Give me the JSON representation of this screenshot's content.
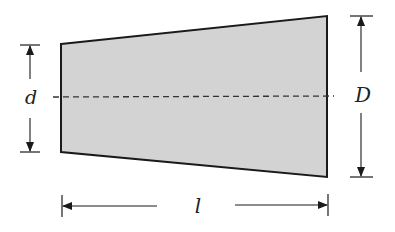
{
  "diagram": {
    "type": "tapered-shaft-cross-section",
    "colors": {
      "fill": "#d3d3d3",
      "stroke": "#1a1a1a",
      "background": "#ffffff"
    },
    "labels": {
      "small_diameter": "d",
      "large_diameter": "D",
      "length": "l"
    },
    "geometry": {
      "left_edge": {
        "x": 61,
        "y_top": 44,
        "y_bottom": 152
      },
      "right_edge": {
        "x": 327,
        "y_top": 16,
        "y_bottom": 177
      },
      "centerline_y": 97
    }
  }
}
